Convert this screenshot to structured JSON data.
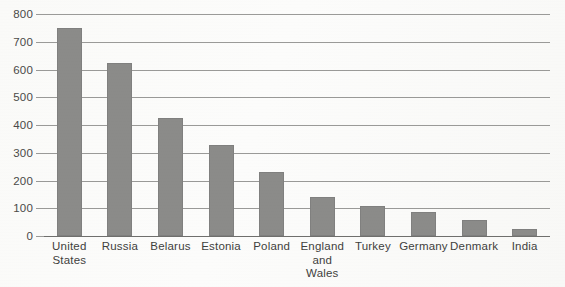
{
  "chart_data": {
    "type": "bar",
    "title": "",
    "subtitle": "",
    "xlabel": "",
    "ylabel": "",
    "ylim": [
      0,
      800
    ],
    "yticks": [
      0,
      100,
      200,
      300,
      400,
      500,
      600,
      700,
      800
    ],
    "ytick_labels": [
      "0",
      "100",
      "200",
      "300",
      "400",
      "500",
      "600",
      "700",
      "800"
    ],
    "grid": "horizontal",
    "legend": "none",
    "orientation": "vertical",
    "bar_color": "#8b8b89",
    "categories": [
      "United\nStates",
      "Russia",
      "Belarus",
      "Estonia",
      "Poland",
      "England\nand\nWales",
      "Turkey",
      "Germany",
      "Denmark",
      "India"
    ],
    "values": [
      750,
      623,
      425,
      328,
      230,
      140,
      108,
      88,
      58,
      25
    ]
  },
  "axis": {
    "y": {
      "ticks": [
        {
          "label": "800",
          "value": 800
        },
        {
          "label": "700",
          "value": 700
        },
        {
          "label": "600",
          "value": 600
        },
        {
          "label": "500",
          "value": 500
        },
        {
          "label": "400",
          "value": 400
        },
        {
          "label": "300",
          "value": 300
        },
        {
          "label": "200",
          "value": 200
        },
        {
          "label": "100",
          "value": 100
        },
        {
          "label": "0",
          "value": 0
        }
      ]
    }
  }
}
